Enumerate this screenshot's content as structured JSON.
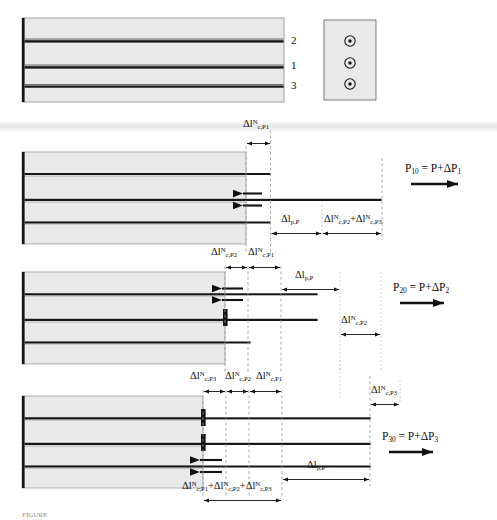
{
  "figure": {
    "colors": {
      "matrix_fill": "#e9e9e9",
      "matrix_stroke": "#8a8a8a",
      "fiber_dark": "#111111",
      "guide_dashed": "#9a9a9a",
      "background": "#ffffff",
      "caption_gray": "#8d8d8d"
    }
  },
  "panel0": {
    "name": "undamaged-specimen",
    "fiber_labels": [
      "2",
      "1",
      "3"
    ],
    "cross_section": {
      "name": "cross-section-inset",
      "fiber_count": 3
    }
  },
  "panel1": {
    "name": "stage-1-pullout",
    "top_dim": {
      "delta": "Δl",
      "sup": "N",
      "sub": "c,P1"
    },
    "dims": [
      {
        "delta": "Δl",
        "sup": "",
        "sub": "p,P"
      },
      {
        "delta": "Δl",
        "sup": "N",
        "sub": "c,P2",
        "plus": "+",
        "delta2": "Δl",
        "sup2": "N",
        "sub2": "c,P3"
      }
    ],
    "force": {
      "symbol": "P",
      "sub": "10",
      "equals": "=",
      "rhs_p": "P+",
      "rhs_delta": "ΔP",
      "rhs_sub": "1"
    }
  },
  "panel2": {
    "name": "stage-2-pullout",
    "top_dims": [
      {
        "delta": "Δl",
        "sup": "N",
        "sub": "c,P2"
      },
      {
        "delta": "Δl",
        "sup": "N",
        "sub": "c,P1"
      }
    ],
    "mid_dim": {
      "delta": "Δl",
      "sup": "",
      "sub": "p,P"
    },
    "right_dim": {
      "delta": "Δl",
      "sup": "N",
      "sub": "c,P2"
    },
    "force": {
      "symbol": "P",
      "sub": "20",
      "equals": "=",
      "rhs_p": "P+",
      "rhs_delta": "ΔP",
      "rhs_sub": "2"
    }
  },
  "panel3": {
    "name": "stage-3-pullout",
    "top_dims": [
      {
        "delta": "Δl",
        "sup": "N",
        "sub": "c,P3"
      },
      {
        "delta": "Δl",
        "sup": "N",
        "sub": "c,P2"
      },
      {
        "delta": "Δl",
        "sup": "N",
        "sub": "c,P1"
      }
    ],
    "right_dim": {
      "delta": "Δl",
      "sup": "N",
      "sub": "c,P3"
    },
    "mid_dim": {
      "delta": "Δl",
      "sup": "",
      "sub": "p,P"
    },
    "sum_dim": {
      "t1_delta": "Δl",
      "t1_sup": "N",
      "t1_sub": "c,P1",
      "op1": "+",
      "t2_delta": "Δl",
      "t2_sup": "N",
      "t2_sub": "c,P2",
      "op2": "+",
      "t3_delta": "Δl",
      "t3_sup": "N",
      "t3_sub": "c,P3"
    },
    "force": {
      "symbol": "P",
      "sub": "30",
      "equals": "=",
      "rhs_p": "P+",
      "rhs_delta": "ΔP",
      "rhs_sub": "3"
    }
  },
  "caption": {
    "text": "FIGURE"
  }
}
